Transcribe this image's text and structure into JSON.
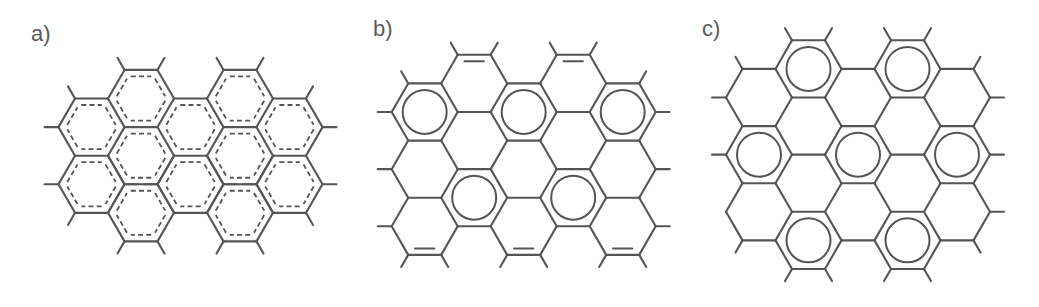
{
  "figure": {
    "line_color": "#555555",
    "label_color": "#5a5a5a",
    "bond_length": 33,
    "panels": [
      {
        "id": "a",
        "label": "a)",
        "label_pos": [
          31,
          41
        ],
        "origin_x": 91.5,
        "even_y0": 127.1,
        "odd_y0": 98.5,
        "inner_style": "dashed",
        "columns": [
          {
            "col": 0,
            "rows": [
              0,
              1
            ]
          },
          {
            "col": 1,
            "rows": [
              0,
              1,
              2
            ]
          },
          {
            "col": 2,
            "rows": [
              0,
              1
            ]
          },
          {
            "col": 3,
            "rows": [
              0,
              1,
              2
            ]
          },
          {
            "col": 4,
            "rows": [
              0,
              1
            ]
          }
        ],
        "circles": [],
        "double_bonds": [],
        "dashed_rings": "all",
        "stub_exclusions": []
      },
      {
        "id": "b",
        "label": "b)",
        "label_pos": [
          373,
          36
        ],
        "origin_x": 424.7,
        "even_y0": 112,
        "odd_y0": 83.4,
        "inner_style": "clar",
        "columns": [
          {
            "col": 0,
            "rows": [
              0,
              1,
              2
            ]
          },
          {
            "col": 1,
            "rows": [
              0,
              1,
              2
            ]
          },
          {
            "col": 2,
            "rows": [
              0,
              1,
              2
            ]
          },
          {
            "col": 3,
            "rows": [
              0,
              1,
              2
            ]
          },
          {
            "col": 4,
            "rows": [
              0,
              1,
              2
            ]
          }
        ],
        "circles": [
          [
            0,
            0
          ],
          [
            2,
            0
          ],
          [
            4,
            0
          ],
          [
            1,
            2
          ],
          [
            3,
            2
          ]
        ],
        "double_bonds": [
          {
            "col": 1,
            "row": 0,
            "edge": "top"
          },
          {
            "col": 3,
            "row": 0,
            "edge": "top"
          },
          {
            "col": 0,
            "row": 2,
            "edge": "bottom"
          },
          {
            "col": 2,
            "row": 2,
            "edge": "bottom"
          },
          {
            "col": 4,
            "row": 2,
            "edge": "bottom"
          }
        ],
        "dashed_rings": "none",
        "stub_exclusions": []
      },
      {
        "id": "c",
        "label": "c)",
        "label_pos": [
          702,
          36
        ],
        "origin_x": 759,
        "even_y0": 97.5,
        "odd_y0": 68.9,
        "inner_style": "clar",
        "columns": [
          {
            "col": 0,
            "rows": [
              0,
              1,
              2
            ]
          },
          {
            "col": 1,
            "rows": [
              0,
              1,
              2,
              3
            ]
          },
          {
            "col": 2,
            "rows": [
              0,
              1,
              2
            ]
          },
          {
            "col": 3,
            "rows": [
              0,
              1,
              2,
              3
            ]
          },
          {
            "col": 4,
            "rows": [
              0,
              1,
              2
            ]
          }
        ],
        "circles": [
          [
            1,
            0
          ],
          [
            3,
            0
          ],
          [
            0,
            1
          ],
          [
            2,
            1
          ],
          [
            4,
            1
          ],
          [
            1,
            3
          ],
          [
            3,
            3
          ]
        ],
        "double_bonds": [],
        "dashed_rings": "none",
        "stub_exclusions": [
          [
            0,
            2,
            "left"
          ]
        ]
      }
    ]
  }
}
